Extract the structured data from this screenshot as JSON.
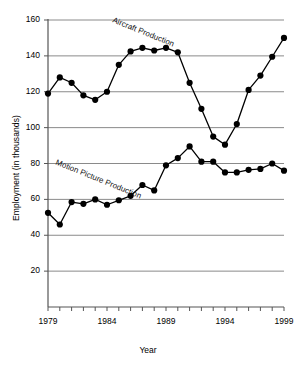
{
  "chart_data": {
    "type": "line",
    "title": "",
    "xlabel": "Year",
    "ylabel": "Employment (in thousands)",
    "xlim": [
      1979,
      1999
    ],
    "ylim": [
      0,
      160
    ],
    "grid": true,
    "gridlines_y": [
      20,
      40,
      60,
      80,
      100,
      120,
      140,
      160
    ],
    "yticks": [
      160,
      140,
      120,
      100,
      80,
      60,
      40,
      20
    ],
    "ytick_labels": [
      "160",
      "140",
      "120",
      "100",
      "80",
      "60",
      "40",
      "20"
    ],
    "xticks": [
      1979,
      1984,
      1989,
      1994,
      1999
    ],
    "xtick_labels": [
      "1979",
      "1984",
      "1989",
      "1994",
      "1999"
    ],
    "x": [
      1979,
      1980,
      1981,
      1982,
      1983,
      1984,
      1985,
      1986,
      1987,
      1988,
      1989,
      1990,
      1991,
      1992,
      1993,
      1994,
      1995,
      1996,
      1997,
      1998,
      1999
    ],
    "legend_position": "inline-annotation",
    "marker": "filled-circle",
    "line_color": "#000000",
    "series": [
      {
        "name": "Aircraft Production",
        "label": "Aircraft Production",
        "values": [
          119,
          128,
          125,
          118,
          115.5,
          120,
          135,
          142.5,
          144.5,
          143,
          144.5,
          142,
          125,
          110.5,
          95,
          90.5,
          102,
          121,
          129,
          139.5,
          150
        ],
        "label_x": 1987,
        "label_y": 152,
        "label_rotation": 22
      },
      {
        "name": "Motion Picture Production",
        "label": "Motion Picture Production",
        "values": [
          52.5,
          46,
          58.5,
          57.5,
          60,
          57,
          59.5,
          62,
          68,
          65,
          79,
          83,
          89.5,
          81,
          81,
          75,
          75,
          76.5,
          77,
          80,
          76
        ],
        "label_x": 1983.2,
        "label_y": 70,
        "label_rotation": 22
      }
    ]
  },
  "axis": {
    "x_title": "Year",
    "y_title": "Employment (in thousands)"
  }
}
